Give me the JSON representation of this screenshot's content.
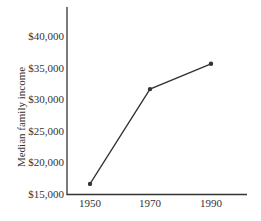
{
  "chart_data": {
    "type": "line",
    "title": "",
    "xlabel": "",
    "ylabel": "Median family income",
    "x": [
      1950,
      1970,
      1990
    ],
    "categories": [
      "1950",
      "1970",
      "1990"
    ],
    "series": [
      {
        "name": "Median family income",
        "values": [
          16600,
          31600,
          35600
        ],
        "color": "#333333"
      }
    ],
    "ylim": [
      15000,
      45000
    ],
    "yticks": [
      15000,
      20000,
      25000,
      30000,
      35000,
      40000
    ],
    "ytick_labels": [
      "$15,000",
      "$20,000",
      "$25,000",
      "$30,000",
      "$35,000",
      "$40,000"
    ],
    "xtick_labels": [
      "1950",
      "1970",
      "1990"
    ],
    "grid": false,
    "legend": null
  }
}
